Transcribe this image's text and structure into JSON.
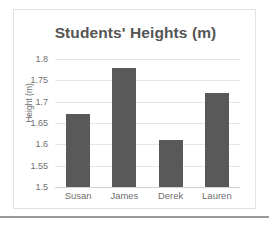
{
  "chart_data": {
    "type": "bar",
    "title": "Students' Heights (m)",
    "xlabel": "",
    "ylabel": "Height (m)",
    "categories": [
      "Susan",
      "James",
      "Derek",
      "Lauren"
    ],
    "values": [
      1.67,
      1.78,
      1.61,
      1.72
    ],
    "ylim": [
      1.5,
      1.8
    ],
    "yticks": [
      "1.5",
      "1.55",
      "1.6",
      "1.65",
      "1.7",
      "1.75",
      "1.8"
    ],
    "ytick_values": [
      1.5,
      1.55,
      1.6,
      1.65,
      1.7,
      1.75,
      1.8
    ],
    "grid": true,
    "legend": false,
    "series_color": "#595959",
    "gridline_color": "#e6e6e6",
    "title_color": "#555555",
    "tick_color": "#707070"
  }
}
